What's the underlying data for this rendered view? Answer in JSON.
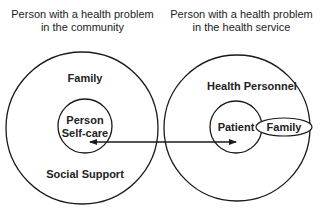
{
  "left_panel": {
    "heading_line1": "Person with a health problem",
    "heading_line2": "in the community",
    "outer_top_label": "Family",
    "outer_bottom_label": "Social Support",
    "inner_line1": "Person",
    "inner_line2": "Self-care"
  },
  "right_panel": {
    "heading_line1": "Person with a health problem",
    "heading_line2": "in the health service",
    "outer_label": "Health Personnel",
    "inner_label": "Patient",
    "ellipse_label": "Family"
  },
  "connector": {
    "type": "double-headed-arrow",
    "from": "Person Self-care",
    "to": "Patient"
  },
  "colors": {
    "stroke": "#1a1a1a",
    "text": "#222222",
    "background": "#ffffff"
  }
}
